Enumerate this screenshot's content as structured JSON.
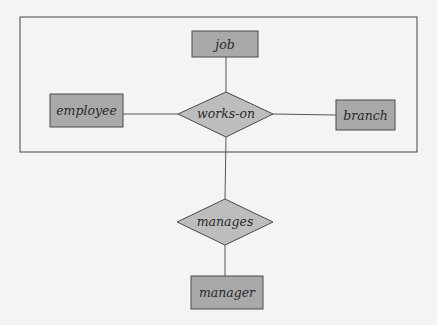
{
  "diagram": {
    "type": "E-R diagram with aggregation",
    "aggregation_box": {
      "contains": [
        "job",
        "employee",
        "works-on",
        "branch"
      ]
    },
    "entities": [
      {
        "id": "job",
        "label": "job"
      },
      {
        "id": "employee",
        "label": "employee"
      },
      {
        "id": "branch",
        "label": "branch"
      },
      {
        "id": "manager",
        "label": "manager"
      }
    ],
    "relationships": [
      {
        "id": "works-on",
        "label": "works-on",
        "connects": [
          "job",
          "employee",
          "branch"
        ]
      },
      {
        "id": "manages",
        "label": "manages",
        "connects": [
          "works-on aggregation",
          "manager"
        ]
      }
    ],
    "colors": {
      "entity_fill": "#a9a9a9",
      "relationship_fill": "#bdbdbd",
      "background": "#f4f4f2",
      "stroke": "#4a4a4a"
    }
  }
}
